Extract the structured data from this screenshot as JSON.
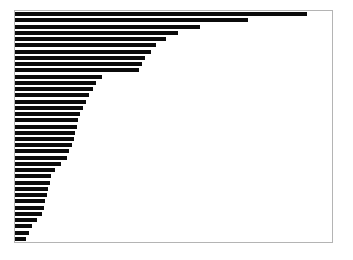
{
  "figure": {
    "background_color": "#ffffff",
    "frame_color": "#b4b4b4",
    "bar_color": "#0b0b0b"
  },
  "chart_data": {
    "type": "bar",
    "orientation": "horizontal",
    "title": "",
    "subtitle": "",
    "xlabel": "",
    "ylabel": "",
    "grid": false,
    "legend": null,
    "legend_position": "none",
    "axis_ticks_visible": false,
    "tick_labels_visible": false,
    "sorted": "descending",
    "xlim": [
      0,
      100
    ],
    "categories": [
      "c01",
      "c02",
      "c03",
      "c04",
      "c05",
      "c06",
      "c07",
      "c08",
      "c09",
      "c10",
      "c11",
      "c12",
      "c13",
      "c14",
      "c15",
      "c16",
      "c17",
      "c18",
      "c19",
      "c20",
      "c21",
      "c22",
      "c23",
      "c24",
      "c25",
      "c26",
      "c27",
      "c28",
      "c29",
      "c30",
      "c31",
      "c32",
      "c33",
      "c34",
      "c35",
      "c36",
      "c37"
    ],
    "values": [
      92.0,
      73.5,
      58.5,
      51.5,
      47.5,
      44.5,
      43.0,
      41.0,
      40.0,
      39.0,
      27.5,
      25.5,
      24.5,
      23.5,
      22.5,
      21.5,
      20.5,
      20.0,
      19.5,
      19.0,
      18.5,
      18.0,
      17.0,
      16.5,
      14.5,
      12.5,
      11.5,
      11.0,
      10.5,
      10.0,
      9.5,
      9.0,
      8.5,
      7.0,
      5.5,
      4.5,
      3.5
    ]
  }
}
